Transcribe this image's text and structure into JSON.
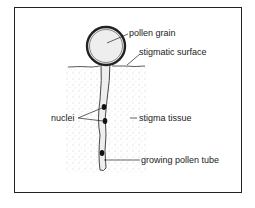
{
  "diagram": {
    "labels": {
      "pollen_grain": "pollen grain",
      "stigmatic_surface": "stigmatic surface",
      "nuclei": "nuclei",
      "stigma_tissue": "stigma tissue",
      "growing_pollen_tube": "growing pollen tube"
    },
    "colors": {
      "line": "#222222",
      "fill": "#eeeeee",
      "stipple": "#cccccc"
    }
  }
}
